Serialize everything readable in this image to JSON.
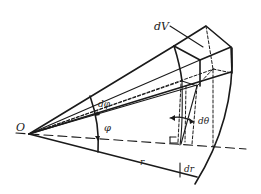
{
  "figure": {
    "type": "spherical-volume-element-diagram",
    "labels": {
      "origin": "O",
      "volume_element": "dV",
      "azimuth_increment": "dφ",
      "polar_angle": "φ",
      "polar_increment": "dθ",
      "radius": "r",
      "radius_increment": "dr"
    },
    "colors": {
      "line": "#1a1a1a",
      "background": "#ffffff"
    }
  }
}
